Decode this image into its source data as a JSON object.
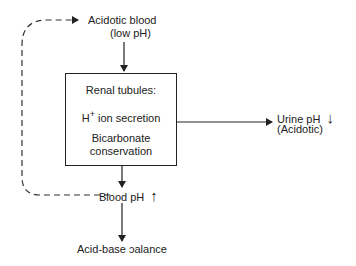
{
  "nodes": {
    "acidotic_blood": {
      "line1": "Acidotic blood",
      "line2": "(low pH)"
    },
    "renal_tubules": {
      "title": "Renal tubules:",
      "secretion_prefix": "H",
      "secretion_sup": "+",
      "secretion_suffix": " ion secretion",
      "conservation_line1": "Bicarbonate",
      "conservation_line2": "conservation"
    },
    "urine_ph": {
      "line1": "Urine pH",
      "line2": "(Acidotic)",
      "trend_icon": "↓"
    },
    "blood_ph": {
      "label": "Blood pH",
      "trend_icon": "↑"
    },
    "acid_base_balance": {
      "label": "Acid-base ɔalance"
    }
  },
  "edges": [
    {
      "from": "acidotic_blood",
      "to": "renal_tubules",
      "style": "solid"
    },
    {
      "from": "renal_tubules",
      "to": "urine_ph",
      "style": "solid"
    },
    {
      "from": "renal_tubules",
      "to": "blood_ph",
      "style": "solid"
    },
    {
      "from": "blood_ph",
      "to": "acid_base_balance",
      "style": "solid"
    },
    {
      "from": "blood_ph",
      "to": "acidotic_blood",
      "style": "dashed",
      "meaning": "feedback"
    }
  ]
}
